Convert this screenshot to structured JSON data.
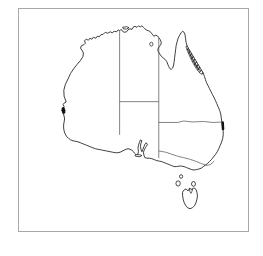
{
  "figure": {
    "title": "",
    "caption": "",
    "background_color": "#ffffff",
    "frame_color": "#a8a8a8"
  },
  "map": {
    "name": "australia-outline-map",
    "region": "Australia",
    "projection_note": "simple outline",
    "coastline_color": "#1a1a1a",
    "border_color": "#4d4d4d",
    "land_fill": "#ffffff",
    "highlight_color": "#2b2b2b",
    "states": [
      {
        "code": "WA",
        "name": "Western Australia"
      },
      {
        "code": "NT",
        "name": "Northern Territory"
      },
      {
        "code": "SA",
        "name": "South Australia"
      },
      {
        "code": "QLD",
        "name": "Queensland"
      },
      {
        "code": "NSW",
        "name": "New South Wales"
      },
      {
        "code": "VIC",
        "name": "Victoria"
      },
      {
        "code": "TAS",
        "name": "Tasmania"
      }
    ],
    "islands": [
      {
        "name": "Tasmania"
      },
      {
        "name": "King Island"
      },
      {
        "name": "Flinders Island"
      },
      {
        "name": "Kangaroo Island"
      },
      {
        "name": "Melville Island"
      }
    ],
    "highlights": [
      {
        "name": "queensland-coastal-strip",
        "label": "Queensland tropical coast",
        "shading": "dark-hatched"
      },
      {
        "name": "perth-coastal-marker",
        "label": "South-west Western Australia coast",
        "shading": "dark"
      },
      {
        "name": "sydney-coastal-marker",
        "label": "Central New South Wales coast",
        "shading": "dark"
      }
    ]
  }
}
